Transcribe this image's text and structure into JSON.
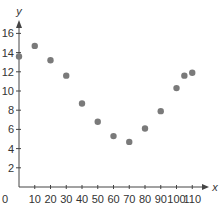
{
  "chart_data": {
    "type": "scatter",
    "title": "",
    "xlabel": "x",
    "ylabel": "y",
    "xlim": [
      0,
      115
    ],
    "ylim": [
      0,
      17
    ],
    "grid": false,
    "legend": null,
    "x_ticks": [
      0,
      10,
      20,
      30,
      40,
      50,
      60,
      70,
      80,
      90,
      100,
      110
    ],
    "y_ticks": [
      2,
      4,
      6,
      8,
      10,
      12,
      14,
      16
    ],
    "x_tick_labels": [
      "0",
      "10",
      "20",
      "30",
      "40",
      "50",
      "60",
      "70",
      "80",
      "90",
      "100",
      "110"
    ],
    "y_tick_labels": [
      "2",
      "4",
      "6",
      "8",
      "10",
      "12",
      "14",
      "16"
    ],
    "points": [
      {
        "x": 0,
        "y": 13.6
      },
      {
        "x": 10,
        "y": 14.7
      },
      {
        "x": 20,
        "y": 13.2
      },
      {
        "x": 30,
        "y": 11.6
      },
      {
        "x": 40,
        "y": 8.7
      },
      {
        "x": 50,
        "y": 6.8
      },
      {
        "x": 60,
        "y": 5.3
      },
      {
        "x": 70,
        "y": 4.7
      },
      {
        "x": 80,
        "y": 6.1
      },
      {
        "x": 90,
        "y": 7.9
      },
      {
        "x": 100,
        "y": 10.3
      },
      {
        "x": 105,
        "y": 11.6
      },
      {
        "x": 110,
        "y": 11.9
      }
    ],
    "colors": {
      "point": "#7a7a7a",
      "axis": "#444444",
      "text": "#333333"
    }
  }
}
